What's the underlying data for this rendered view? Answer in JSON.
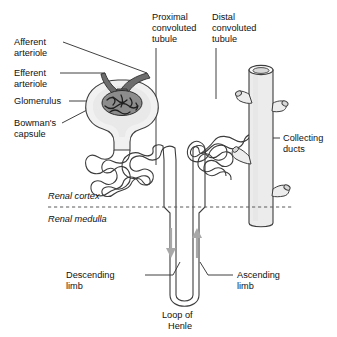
{
  "figure": {
    "background_color": "#ffffff"
  },
  "labels": {
    "afferent_arteriole": "Afferent\narteriole",
    "afferent_arteriole_line1": "Afferent",
    "afferent_arteriole_line2": "arteriole",
    "efferent_arteriole_line1": "Efferent",
    "efferent_arteriole_line2": "arteriole",
    "glomerulus": "Glomerulus",
    "bowmans_capsule_line1": "Bowman's",
    "bowmans_capsule_line2": "capsule",
    "proximal_line1": "Proximal",
    "proximal_line2": "convoluted",
    "proximal_line3": "tubule",
    "distal_line1": "Distal",
    "distal_line2": "convoluted",
    "distal_line3": "tubule",
    "collecting_ducts_line1": "Collecting",
    "collecting_ducts_line2": "ducts",
    "renal_cortex": "Renal cortex",
    "renal_medulla": "Renal medulla",
    "descending_limb_line1": "Descending",
    "descending_limb_line2": "limb",
    "ascending_limb_line1": "Ascending",
    "ascending_limb_line2": "limb",
    "loop_of_henle_line1": "Loop of",
    "loop_of_henle_line2": "Henle"
  },
  "colors": {
    "outline": "#3d3d3d",
    "arteriole_fill": "#6d6d6d",
    "glomerulus_fill": "#8c8c8c",
    "capsule_fill": "#f1f1f1",
    "duct_fill": "#ececec",
    "arrow": "#a8a8a8",
    "divider": "#5a5a5a",
    "text": "#111111"
  }
}
